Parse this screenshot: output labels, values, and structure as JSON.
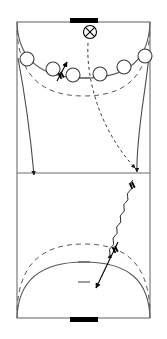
{
  "diagram": {
    "sport": "handball",
    "view": "full-court-vertical",
    "width": 167,
    "height": 339,
    "background_color": "#ffffff",
    "line_color": "#555555",
    "marker_color": "#000000",
    "goal_color": "#000000"
  },
  "court": {
    "outer_boundary": {
      "label": "sideline-boundary",
      "x": 17,
      "y": 22,
      "width": 133,
      "height": 296,
      "stroke": "#666666",
      "stroke_width": 1
    },
    "center_line": {
      "label": "center-line",
      "y": 173,
      "x1": 17,
      "x2": 150,
      "stroke": "#666666"
    },
    "top_goal": {
      "label": "top-goal",
      "x": 70,
      "y": 18,
      "width": 28,
      "height": 5,
      "color": "#000000"
    },
    "bottom_goal": {
      "label": "bottom-goal",
      "x": 70,
      "y": 317,
      "width": 28,
      "height": 5,
      "color": "#000000"
    },
    "top_six_metre_line": {
      "label": "top-6m-goal-area-line",
      "style": "solid",
      "path": "M 17,22 C 18,58 38,78 84,78 C 130,78 149,58 150,22"
    },
    "top_nine_metre_line": {
      "label": "top-9m-free-throw-line",
      "style": "dashed",
      "dash": "5,4",
      "path": "M 17,30 C 19,74 40,96 84,96 C 128,96 148,74 150,30"
    },
    "bottom_six_metre_line": {
      "label": "bottom-6m-goal-area-line",
      "style": "solid",
      "path": "M 17,318 C 18,282 38,262 84,262 C 130,262 149,282 150,318"
    },
    "bottom_nine_metre_line": {
      "label": "bottom-9m-free-throw-line",
      "style": "dashed",
      "dash": "5,4",
      "path": "M 17,310 C 19,266 40,244 84,244 C 128,244 148,266 150,310"
    },
    "bottom_seven_metre_mark": {
      "label": "bottom-7m-penalty-mark",
      "x1": 78,
      "x2": 90,
      "y": 262,
      "style": "solid"
    },
    "bottom_four_metre_mark": {
      "label": "bottom-4m-goalkeeper-line",
      "x1": 78,
      "x2": 90,
      "y": 282,
      "style": "solid"
    },
    "top_seven_metre_mark": {
      "label": "top-7m-penalty-mark",
      "x1": 78,
      "x2": 90,
      "y": 78,
      "style": "solid"
    }
  },
  "players": [
    {
      "id": "p1",
      "label": "defender-left-wing",
      "cx": 27,
      "cy": 59,
      "r": 7
    },
    {
      "id": "p2",
      "label": "defender-left-back",
      "cx": 53,
      "cy": 69,
      "r": 7
    },
    {
      "id": "p3",
      "label": "defender-left-centre",
      "cx": 73,
      "cy": 75,
      "r": 7
    },
    {
      "id": "p4",
      "label": "defender-right-centre",
      "cx": 100,
      "cy": 74,
      "r": 7
    },
    {
      "id": "p5",
      "label": "defender-right-back",
      "cx": 124,
      "cy": 67,
      "r": 7
    },
    {
      "id": "p6",
      "label": "defender-right-wing",
      "cx": 145,
      "cy": 56,
      "r": 7
    }
  ],
  "ball": {
    "label": "ball-marker",
    "cx": 90,
    "cy": 32,
    "r": 6.5,
    "glyph": "circle-with-cross"
  },
  "movements": [
    {
      "id": "m1",
      "label": "pass-trajectory-ball-to-court",
      "type": "pass",
      "style": "dashed",
      "dash": "3,3",
      "path": "M 88,43 C 86,80 100,130 135,168",
      "arrowhead": true
    },
    {
      "id": "m2",
      "label": "dribble-path-zigzag",
      "type": "dribble",
      "style": "wavy",
      "path": "M 133,180 L 108,258",
      "arrowhead": true
    },
    {
      "id": "m3",
      "label": "player-run-left-sideline",
      "type": "run",
      "style": "solid",
      "path": "M 18,58 C 24,90 30,130 34,175",
      "arrowhead": true
    },
    {
      "id": "m4",
      "label": "player-run-right-sideline",
      "type": "run",
      "style": "solid",
      "path": "M 149,55 C 146,90 136,135 137,172",
      "arrowhead": true
    },
    {
      "id": "m5",
      "label": "shot-on-goal-arrow",
      "type": "shot",
      "style": "solid-double-bar",
      "path": "M 118,242 L 96,288",
      "arrowhead": true
    },
    {
      "id": "m6",
      "label": "screen-arrow-attacker",
      "type": "screen",
      "style": "solid-double-bar",
      "path": "M 57,81 L 67,62",
      "arrowhead": true
    }
  ],
  "annotations": {
    "bar_marks": [
      {
        "label": "pass-bar-mark-upper",
        "x": 131,
        "y": 186,
        "angle": 64
      },
      {
        "label": "pass-bar-mark-shot",
        "x": 114,
        "y": 250,
        "angle": 64
      },
      {
        "label": "screen-bar-mark",
        "x": 60,
        "y": 76,
        "angle": 62
      }
    ]
  }
}
